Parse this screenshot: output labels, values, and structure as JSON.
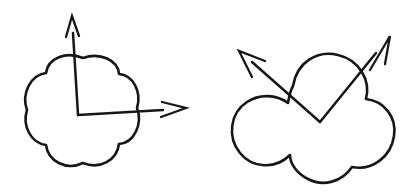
{
  "figure": {
    "title": "Two hand-drawn clover outlines with vector pairs",
    "background_color": "#ffffff",
    "ink_color": "#16161a",
    "canvas": {
      "width": 410,
      "height": 192
    },
    "panels": [
      {
        "id": "left-panel",
        "name": "four-lobed-clover-with-right-angle-vectors",
        "shape": {
          "name": "four-lobed-clover",
          "lobes": 4,
          "center": [
            83,
            118
          ],
          "radius": 60,
          "path": "M 83 58 C 100 52 118 60 119 74 C 133 75 142 92 137 108 C 143 124 134 143 119 144 C 117 160 100 170 83 163 C 66 171 48 161 46 145 C 31 143 22 126 27 110 C 21 93 31 75 46 73 C 48 58 66 51 83 58 Z"
        },
        "vectors": [
          {
            "name": "vertical-up-vector",
            "label": "up",
            "origin": [
              78,
              115
            ],
            "tip": [
              72,
              16
            ],
            "shaft": "M 78 115 L 73 33",
            "head": "M 66 37 L 72 16 L 79 36",
            "direction": "up"
          },
          {
            "name": "horizontal-right-vector",
            "label": "right",
            "origin": [
              78,
              115
            ],
            "tip": [
              186,
              108
            ],
            "shaft": "M 78 115 L 163 110",
            "head": "M 162 102 L 186 108 L 161 117",
            "direction": "right"
          }
        ],
        "angle_marker": {
          "name": "right-angle-vertex",
          "at": [
            78,
            115
          ],
          "degrees": 90
        }
      },
      {
        "id": "right-panel",
        "name": "three-lobed-clover-with-v-vectors",
        "shape": {
          "name": "three-lobed-clover",
          "lobes": 3,
          "center": [
            315,
            120
          ],
          "radius": 62,
          "path": "M 293 86 C 297 62 317 50 338 55 C 359 60 371 80 366 99 C 384 101 397 117 394 136 C 391 157 372 171 352 167 C 342 182 323 187 308 179 C 296 173 290 163 290 155 C 275 170 252 168 240 153 C 227 137 230 113 247 102 C 259 94 276 94 288 103 C 289 97 290 91 293 86 Z"
        },
        "vectors": [
          {
            "name": "upper-left-vector",
            "label": "upper-left",
            "origin": [
              320,
              122
            ],
            "tip": [
              239,
              51
            ],
            "shaft": "M 320 122 L 252 62",
            "head": "M 252 77 L 239 51 L 265 61",
            "direction": "up-left"
          },
          {
            "name": "upper-right-vector",
            "label": "upper-right",
            "origin": [
              320,
              122
            ],
            "tip": [
              390,
              36
            ],
            "shaft": "M 320 122 L 376 53",
            "head": "M 370 70 L 390 36 L 385 64",
            "direction": "up-right"
          }
        ],
        "angle_marker": {
          "name": "v-vertex",
          "at": [
            320,
            122
          ],
          "degrees": 95
        }
      }
    ]
  }
}
